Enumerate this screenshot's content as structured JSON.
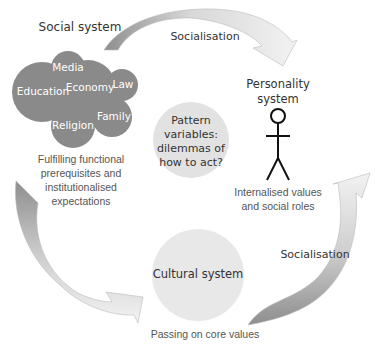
{
  "diagram": {
    "social_system": {
      "title": "Social system",
      "institutions": [
        "Media",
        "Education",
        "Economy",
        "Law",
        "Religion",
        "Family"
      ],
      "caption": [
        "Fulfilling functional",
        "prerequisites and",
        "institutionalised",
        "expectations"
      ]
    },
    "personality_system": {
      "title": [
        "Personality",
        "system"
      ],
      "caption": [
        "Internalised values",
        "and social roles"
      ]
    },
    "center": {
      "text": [
        "Pattern",
        "variables:",
        "dilemmas of",
        "how to act?"
      ]
    },
    "cultural_system": {
      "title": "Cultural system",
      "caption": "Passing on core values"
    },
    "arrows": {
      "top": "Socialisation",
      "right": "Socialisation"
    },
    "colors": {
      "institution_circle": "#8a8a8a",
      "center_circle": "#e2e2e2",
      "arrow_dark": "#9a9a9a",
      "arrow_light": "#ececec"
    }
  }
}
